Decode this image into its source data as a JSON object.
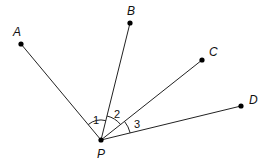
{
  "diagram": {
    "title": "",
    "vertex": {
      "label": "P",
      "x": 101,
      "y": 140,
      "label_x": 97,
      "label_y": 158
    },
    "points": [
      {
        "label": "A",
        "x": 21,
        "y": 44,
        "label_x": 13,
        "label_y": 36
      },
      {
        "label": "B",
        "x": 130,
        "y": 23,
        "label_x": 127,
        "label_y": 15
      },
      {
        "label": "C",
        "x": 202,
        "y": 60,
        "label_x": 209,
        "label_y": 56
      },
      {
        "label": "D",
        "x": 241,
        "y": 106,
        "label_x": 249,
        "label_y": 104
      }
    ],
    "angles": [
      {
        "label": "1",
        "between": [
          "PA",
          "PB"
        ],
        "x": 94,
        "y": 124
      },
      {
        "label": "2",
        "between": [
          "PB",
          "PC"
        ],
        "x": 114,
        "y": 118
      },
      {
        "label": "3",
        "between": [
          "PC",
          "PD"
        ],
        "x": 134,
        "y": 128
      }
    ],
    "line_color": "#222222",
    "point_color": "#000000"
  }
}
